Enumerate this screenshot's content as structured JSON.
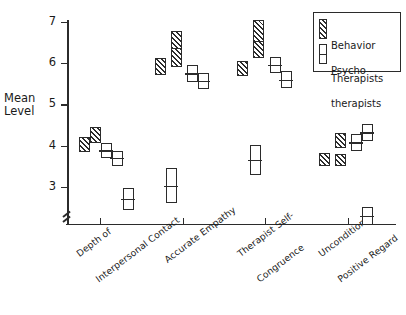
{
  "chart_data": {
    "type": "bar",
    "title": "",
    "xlabel": "",
    "ylabel": "Mean Level",
    "ylim": [
      2,
      7.2
    ],
    "yticks": [
      3,
      4,
      5,
      6,
      7
    ],
    "ytick_labels": [
      "3",
      "4",
      "5",
      "6",
      "7"
    ],
    "grid": false,
    "axis_break": true,
    "legend_position": "top-right",
    "categories": [
      "Depth of\nInterpersonal Contact",
      "Accurate Empathy",
      "Therapist Self-\nCongruence",
      "Unconditional\nPositive Regard"
    ],
    "series": [
      {
        "name": "Behavior Therapists",
        "style": "hatched"
      },
      {
        "name": "Psychotherapists",
        "style": "open"
      }
    ],
    "groups": [
      {
        "category": "Depth of Interpersonal Contact",
        "x_px": 100,
        "boxes": [
          {
            "series": "Behavior Therapists",
            "style": "hatched",
            "low": 3.85,
            "high": 4.2,
            "x_px": 84
          },
          {
            "series": "Behavior Therapists",
            "style": "hatched",
            "low": 4.07,
            "high": 4.45,
            "x_px": 95
          },
          {
            "series": "Psychotherapists",
            "style": "open",
            "low": 3.7,
            "high": 4.07,
            "x_px": 106
          },
          {
            "series": "Psychotherapists",
            "style": "open",
            "low": 3.52,
            "high": 3.88,
            "x_px": 117
          },
          {
            "series": "Psychotherapists",
            "style": "open",
            "low": 2.45,
            "high": 2.98,
            "x_px": 128
          }
        ]
      },
      {
        "category": "Accurate Empathy",
        "x_px": 183,
        "boxes": [
          {
            "series": "Behavior Therapists",
            "style": "hatched",
            "low": 5.72,
            "high": 6.12,
            "x_px": 160
          },
          {
            "series": "Behavior Therapists",
            "style": "hatched",
            "low": 5.9,
            "high": 6.48,
            "x_px": 176
          },
          {
            "series": "Behavior Therapists",
            "style": "hatched",
            "low": 6.35,
            "high": 6.78,
            "x_px": 176
          },
          {
            "series": "Psychotherapists",
            "style": "open",
            "low": 5.55,
            "high": 5.95,
            "x_px": 192
          },
          {
            "series": "Psychotherapists",
            "style": "open",
            "low": 5.38,
            "high": 5.75,
            "x_px": 203
          },
          {
            "series": "Psychotherapists",
            "style": "open",
            "low": 2.62,
            "high": 3.45,
            "x_px": 171
          }
        ]
      },
      {
        "category": "Therapist Self-Congruence",
        "x_px": 265,
        "boxes": [
          {
            "series": "Behavior Therapists",
            "style": "hatched",
            "low": 5.68,
            "high": 6.05,
            "x_px": 242
          },
          {
            "series": "Behavior Therapists",
            "style": "hatched",
            "low": 6.12,
            "high": 6.7,
            "x_px": 258
          },
          {
            "series": "Behavior Therapists",
            "style": "hatched",
            "low": 6.5,
            "high": 7.05,
            "x_px": 258
          },
          {
            "series": "Psychotherapists",
            "style": "open",
            "low": 5.75,
            "high": 6.15,
            "x_px": 275
          },
          {
            "series": "Psychotherapists",
            "style": "open",
            "low": 5.4,
            "high": 5.8,
            "x_px": 286
          },
          {
            "series": "Psychotherapists",
            "style": "open",
            "low": 3.3,
            "high": 4.02,
            "x_px": 255
          }
        ]
      },
      {
        "category": "Unconditional Positive Regard",
        "x_px": 348,
        "boxes": [
          {
            "series": "Behavior Therapists",
            "style": "hatched",
            "low": 3.5,
            "high": 3.82,
            "x_px": 324
          },
          {
            "series": "Behavior Therapists",
            "style": "hatched",
            "low": 3.5,
            "high": 3.8,
            "x_px": 340
          },
          {
            "series": "Behavior Therapists",
            "style": "hatched",
            "low": 3.95,
            "high": 4.3,
            "x_px": 340
          },
          {
            "series": "Psychotherapists",
            "style": "open",
            "low": 3.88,
            "high": 4.28,
            "x_px": 356
          },
          {
            "series": "Psychotherapists",
            "style": "open",
            "low": 4.12,
            "high": 4.52,
            "x_px": 367
          },
          {
            "series": "Psychotherapists",
            "style": "open",
            "low": 2.08,
            "high": 2.52,
            "x_px": 367
          }
        ]
      }
    ]
  },
  "axis": {
    "y_label_line1": "Mean",
    "y_label_line2": "Level",
    "y_ticks": [
      "7",
      "6",
      "5",
      "4",
      "3"
    ]
  },
  "categories_display": [
    {
      "line1": "Depth of",
      "line2": "Interpersonal Contact"
    },
    {
      "line1": "Accurate Empathy",
      "line2": ""
    },
    {
      "line1": "Therapist Self-",
      "line2": "Congruence"
    },
    {
      "line1": "Unconditional",
      "line2": "Positive Regard"
    }
  ],
  "legend": {
    "behavior_line1": "Behavior",
    "behavior_line2": "Therapists",
    "psycho_line1": "Psycho -",
    "psycho_line2": "therapists"
  }
}
